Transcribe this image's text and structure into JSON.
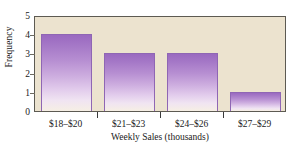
{
  "chart_data": {
    "type": "bar",
    "title": "",
    "categories": [
      "$18–$20",
      "$21–$23",
      "$24–$26",
      "$27–$29"
    ],
    "values": [
      4,
      3,
      3,
      1
    ],
    "xlabel": "Weekly Sales (thousands)",
    "ylabel": "Frequency",
    "ylim": [
      0,
      5
    ],
    "yticks": [
      0,
      1,
      2,
      3,
      4,
      5
    ],
    "ytick_labels": [
      "0",
      "1",
      "2",
      "3",
      "4",
      "5"
    ],
    "grid": false,
    "legend": false,
    "legend_position": "none",
    "colors": {
      "bar_top": "#9a69c0",
      "bar_bottom": "#f6efe4",
      "bar_border": "#8f66b4",
      "plot_background": "#ece3cf",
      "plot_border": "#5d5a52",
      "page_background": "#ffffff",
      "text": "#1a1a1a",
      "tick": "#3a3a3a"
    }
  },
  "clipped_caption": ""
}
